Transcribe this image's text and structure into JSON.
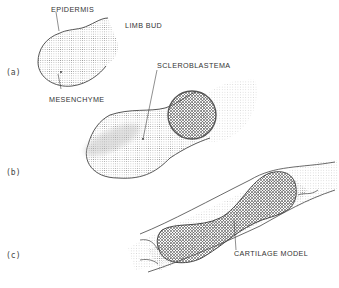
{
  "figure": {
    "panels": [
      {
        "id": "a",
        "label": "(a)",
        "annotations": [
          "EPIDERMIS",
          "LIMB BUD",
          "MESENCHYME"
        ]
      },
      {
        "id": "b",
        "label": "(b)",
        "annotations": [
          "SCLEROBLASTEMA"
        ]
      },
      {
        "id": "c",
        "label": "(c)",
        "annotations": [
          "CARTILAGE MODEL"
        ]
      }
    ],
    "colors": {
      "outline": "#444444",
      "stipple": "#9a9a9a",
      "background": "#ffffff"
    }
  }
}
